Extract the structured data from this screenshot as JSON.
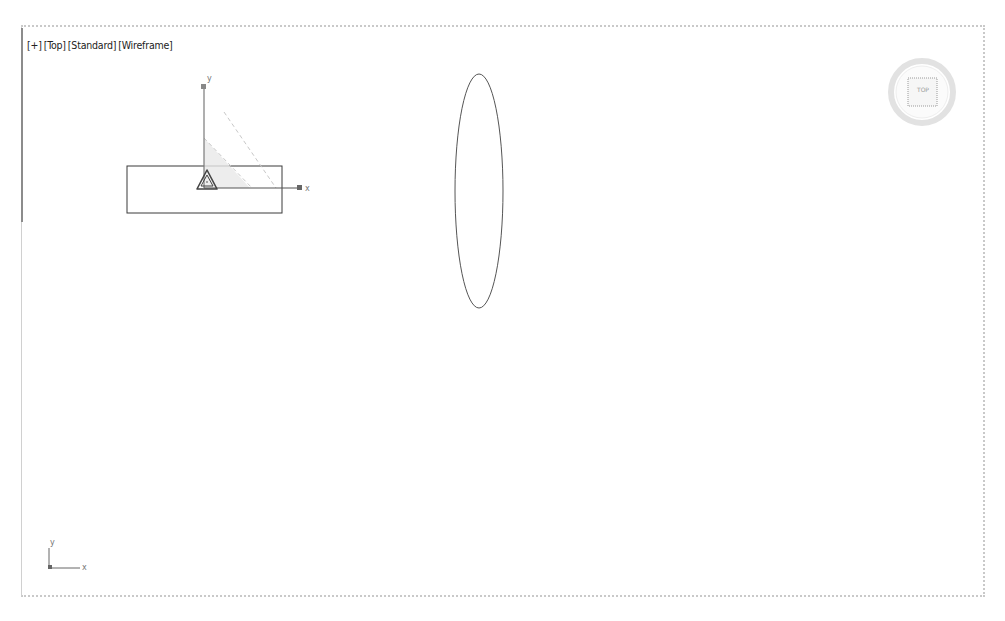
{
  "viewport": {
    "label_parts": [
      "[+]",
      "[Top]",
      "[Standard]",
      "[Wireframe]"
    ],
    "view_name": "Top",
    "shading": "Standard",
    "display_mode": "Wireframe"
  },
  "viewcube": {
    "face_label": "TOP"
  },
  "gizmo": {
    "x_label": "x",
    "y_label": "y"
  },
  "world_axis": {
    "x_label": "x",
    "y_label": "y"
  },
  "colors": {
    "wire": "#3a3a3a",
    "border": "#c9c9c9",
    "gizmo_fill": "#e6e6e6"
  }
}
